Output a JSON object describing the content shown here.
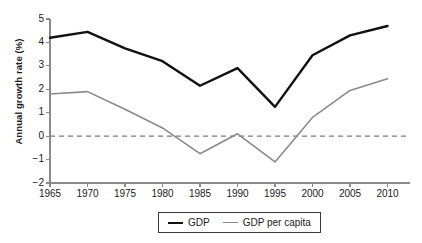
{
  "chart_data": {
    "type": "line",
    "title": "",
    "subtitle": "",
    "xlabel": "",
    "ylabel": "Annual growth rate (%)",
    "x": [
      1965,
      1970,
      1975,
      1980,
      1985,
      1990,
      1995,
      2000,
      2005,
      2010
    ],
    "xtick_labels": [
      "1965",
      "1970",
      "1975",
      "1980",
      "1985",
      "1990",
      "1995",
      "2000",
      "2005",
      "2010"
    ],
    "ytick_labels": [
      "5",
      "4",
      "3",
      "2",
      "1",
      "0",
      "-1",
      "-2"
    ],
    "ytick_values": [
      5,
      4,
      3,
      2,
      1,
      0,
      -1,
      -2
    ],
    "xlim": [
      1965,
      2013
    ],
    "ylim": [
      -2,
      5
    ],
    "grid": false,
    "zero_line": true,
    "zero_line_style": "dashed",
    "legend_position": "bottom-center",
    "series": [
      {
        "name": "GDP",
        "color": "#111111",
        "line_width": 2.4,
        "values": [
          4.2,
          4.45,
          3.75,
          3.2,
          2.15,
          2.9,
          1.25,
          3.45,
          4.3,
          4.7
        ]
      },
      {
        "name": "GDP per capita",
        "color": "#8a8a8a",
        "line_width": 1.6,
        "values": [
          1.8,
          1.9,
          1.15,
          0.35,
          -0.75,
          0.1,
          -1.1,
          0.8,
          1.95,
          2.45
        ]
      }
    ]
  },
  "legend": {
    "items": [
      {
        "label": "GDP"
      },
      {
        "label": "GDP per capita"
      }
    ]
  },
  "colors": {
    "axis": "#8a8a8a",
    "text": "#1a1a1a",
    "gdp_line": "#111111",
    "percapita_line": "#8a8a8a",
    "zero_line": "#7a7a7a",
    "background": "#ffffff"
  }
}
